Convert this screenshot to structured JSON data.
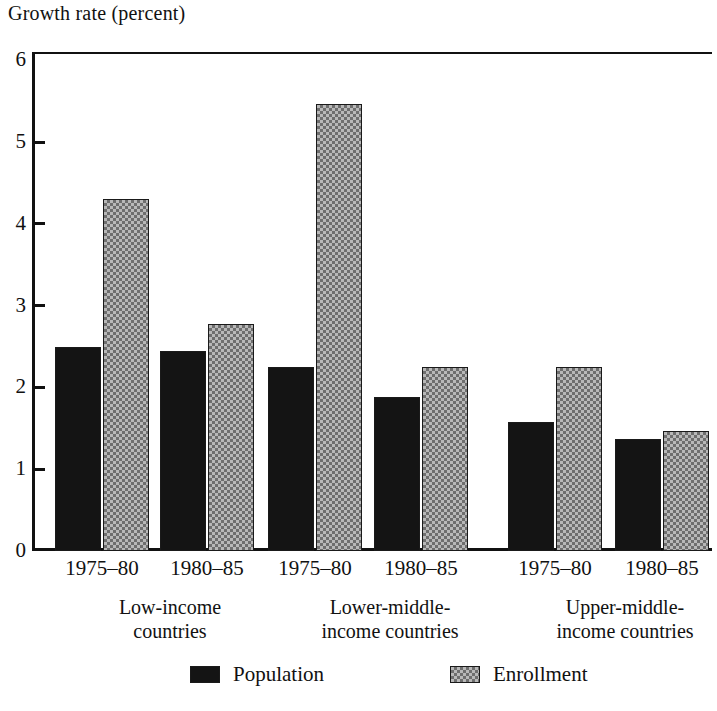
{
  "chart_data": {
    "type": "bar",
    "title": "Growth rate (percent)",
    "xlabel": "",
    "ylabel": "Growth rate (percent)",
    "ylim": [
      0,
      6
    ],
    "yticks": [
      0,
      1,
      2,
      3,
      4,
      5,
      6
    ],
    "grid": false,
    "legend_position": "bottom",
    "categories": [
      "Low-income countries 1975–80",
      "Low-income countries 1980–85",
      "Lower-middle-income countries 1975–80",
      "Lower-middle-income countries 1980–85",
      "Upper-middle-income countries 1975–80",
      "Upper-middle-income countries 1980–85"
    ],
    "series": [
      {
        "name": "Population",
        "color": "#141414",
        "values": [
          2.5,
          2.45,
          2.25,
          1.88,
          1.58,
          1.37
        ]
      },
      {
        "name": "Enrollment",
        "color": "#b8b8b8",
        "values": [
          4.3,
          2.78,
          5.47,
          2.25,
          2.25,
          1.47
        ]
      }
    ],
    "groups": [
      {
        "label_line1": "Low-income",
        "label_line2": "countries",
        "periods": [
          {
            "label": "1975–80",
            "population": 2.5,
            "enrollment": 4.3
          },
          {
            "label": "1980–85",
            "population": 2.45,
            "enrollment": 2.78
          }
        ]
      },
      {
        "label_line1": "Lower-middle-",
        "label_line2": "income countries",
        "periods": [
          {
            "label": "1975–80",
            "population": 2.25,
            "enrollment": 5.47
          },
          {
            "label": "1980–85",
            "population": 1.88,
            "enrollment": 2.25
          }
        ]
      },
      {
        "label_line1": "Upper-middle-",
        "label_line2": "income countries",
        "periods": [
          {
            "label": "1975–80",
            "population": 1.58,
            "enrollment": 2.25
          },
          {
            "label": "1980–85",
            "population": 1.37,
            "enrollment": 1.47
          }
        ]
      }
    ]
  },
  "axis": {
    "tick_labels": [
      "6",
      "5",
      "4",
      "3",
      "2",
      "1",
      "0"
    ]
  },
  "legend": {
    "items": [
      {
        "label": "Population",
        "swatch": "population"
      },
      {
        "label": "Enrollment",
        "swatch": "enrollment"
      }
    ]
  }
}
